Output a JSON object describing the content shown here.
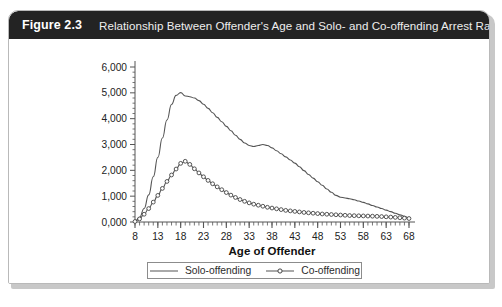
{
  "figure": {
    "number_label": "Figure 2.3",
    "caption": "Relationship Between Offender's Age and Solo- and Co-offending Arrest Rates",
    "header_bg": "#232323",
    "header_text_color": "#ffffff"
  },
  "chart_data": {
    "type": "line",
    "title": "",
    "xlabel": "Age of Offender",
    "ylabel": "",
    "xlim": [
      8,
      68
    ],
    "ylim": [
      0,
      6000
    ],
    "xticks": [
      8,
      13,
      18,
      23,
      28,
      33,
      38,
      43,
      48,
      53,
      58,
      63,
      68
    ],
    "xtick_labels": [
      "8",
      "13",
      "18",
      "23",
      "28",
      "33",
      "38",
      "43",
      "48",
      "53",
      "58",
      "63",
      "68"
    ],
    "x_minor_tick_step": 1,
    "yticks": [
      0,
      1000,
      2000,
      3000,
      4000,
      5000,
      6000
    ],
    "ytick_labels": [
      "0,000",
      "1,000",
      "2,000",
      "3,000",
      "4,000",
      "5,000",
      "6,000"
    ],
    "y_minor_tick_count": 5,
    "grid": false,
    "legend_position": "bottom",
    "line_color": "#555555",
    "marker": "open-circle",
    "x": [
      8,
      9,
      10,
      11,
      12,
      13,
      14,
      15,
      16,
      17,
      18,
      19,
      20,
      21,
      22,
      23,
      24,
      25,
      26,
      27,
      28,
      29,
      30,
      31,
      32,
      33,
      34,
      35,
      36,
      37,
      38,
      39,
      40,
      41,
      42,
      43,
      44,
      45,
      46,
      47,
      48,
      49,
      50,
      51,
      52,
      53,
      54,
      55,
      56,
      57,
      58,
      59,
      60,
      61,
      62,
      63,
      64,
      65,
      66,
      67,
      68
    ],
    "series": [
      {
        "name": "Solo-offending",
        "marker": "none",
        "values": [
          30,
          180,
          520,
          1050,
          1750,
          2500,
          3250,
          3950,
          4550,
          4900,
          5010,
          4880,
          4850,
          4800,
          4700,
          4560,
          4400,
          4230,
          4050,
          3880,
          3700,
          3530,
          3360,
          3200,
          3060,
          2960,
          2920,
          2960,
          3000,
          2960,
          2870,
          2760,
          2640,
          2520,
          2400,
          2280,
          2140,
          1990,
          1840,
          1700,
          1560,
          1420,
          1280,
          1150,
          1030,
          960,
          930,
          900,
          860,
          810,
          760,
          700,
          640,
          580,
          520,
          460,
          400,
          340,
          280,
          220,
          160
        ]
      },
      {
        "name": "Co-offending",
        "marker": "open-circle",
        "values": [
          20,
          120,
          300,
          520,
          770,
          1030,
          1300,
          1570,
          1820,
          2050,
          2270,
          2350,
          2230,
          2060,
          1900,
          1750,
          1610,
          1480,
          1360,
          1250,
          1140,
          1040,
          950,
          870,
          800,
          740,
          690,
          650,
          610,
          570,
          540,
          510,
          480,
          450,
          430,
          410,
          390,
          370,
          355,
          340,
          325,
          310,
          300,
          290,
          280,
          270,
          260,
          250,
          245,
          240,
          235,
          230,
          225,
          218,
          210,
          200,
          190,
          178,
          165,
          150,
          135
        ]
      }
    ]
  },
  "legend": {
    "items": [
      {
        "label": "Solo-offending",
        "marker": "none"
      },
      {
        "label": "Co-offending",
        "marker": "open-circle"
      }
    ]
  }
}
